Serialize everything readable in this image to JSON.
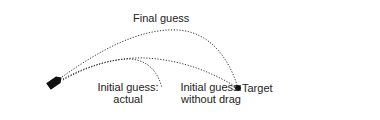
{
  "diagram": {
    "labels": {
      "final_guess": "Final guess",
      "initial_actual_line1": "Initial guess:",
      "initial_actual_line2": "actual",
      "initial_nodrag_line1": "Initial guess:",
      "initial_nodrag_line2": "without drag",
      "target": "Target"
    },
    "elements": {
      "launcher": "cannon-icon",
      "target_marker": "target-dot"
    },
    "trajectories": [
      {
        "name": "final-guess",
        "style": "dotted",
        "from": "cannon",
        "to": "target"
      },
      {
        "name": "initial-guess-without-drag",
        "style": "dotted",
        "from": "cannon",
        "to": "target"
      },
      {
        "name": "initial-guess-actual",
        "style": "dotted",
        "from": "cannon",
        "to": "short-of-target"
      }
    ],
    "colors": {
      "stroke": "#333333",
      "text": "#222222",
      "fill": "#111111",
      "background": "#ffffff"
    }
  }
}
